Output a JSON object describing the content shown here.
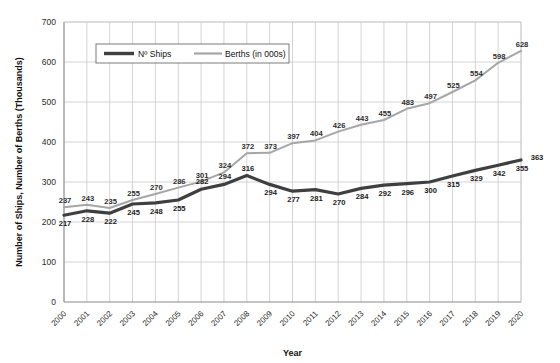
{
  "chart_data": {
    "type": "line",
    "title": "",
    "xlabel": "Year",
    "ylabel": "Number of Ships, Number of Berths (Thousands)",
    "ylim": [
      0,
      700
    ],
    "ytick_step": 100,
    "yticks": [
      "0",
      "100",
      "200",
      "300",
      "400",
      "500",
      "600",
      "700"
    ],
    "grid": true,
    "legend_position": "top-left-inside",
    "categories": [
      "2000",
      "2001",
      "2002",
      "2003",
      "2004",
      "2005",
      "2006",
      "2007",
      "2008",
      "2009",
      "2010",
      "2011",
      "2012",
      "2013",
      "2014",
      "2015",
      "2016",
      "2017",
      "2018",
      "2019",
      "2020"
    ],
    "series": [
      {
        "name": "Nº Ships",
        "color": "#3f3f3f",
        "width": 3.2,
        "values": [
          217,
          228,
          222,
          245,
          248,
          255,
          282,
          294,
          316,
          294,
          277,
          281,
          270,
          284,
          292,
          296,
          300,
          315,
          329,
          342,
          355
        ]
      },
      {
        "name": "Berths (in 000s)",
        "color": "#a6a6a6",
        "width": 2.0,
        "values": [
          237,
          243,
          235,
          255,
          270,
          286,
          301,
          324,
          372,
          373,
          397,
          404,
          426,
          443,
          455,
          483,
          497,
          525,
          554,
          598,
          628
        ]
      }
    ],
    "labels": {
      "ships": [
        "217",
        "228",
        "222",
        "245",
        "248",
        "255",
        "282",
        "294",
        "316",
        "294",
        "277",
        "281",
        "270",
        "284",
        "292",
        "296",
        "300",
        "315",
        "329",
        "342",
        "355"
      ],
      "berths": [
        "237",
        "243",
        "235",
        "255",
        "270",
        "286",
        "301",
        "324",
        "372",
        "373",
        "397",
        "404",
        "426",
        "443",
        "455",
        "483",
        "497",
        "525",
        "554",
        "598",
        "628"
      ]
    },
    "extra_label": "363"
  }
}
